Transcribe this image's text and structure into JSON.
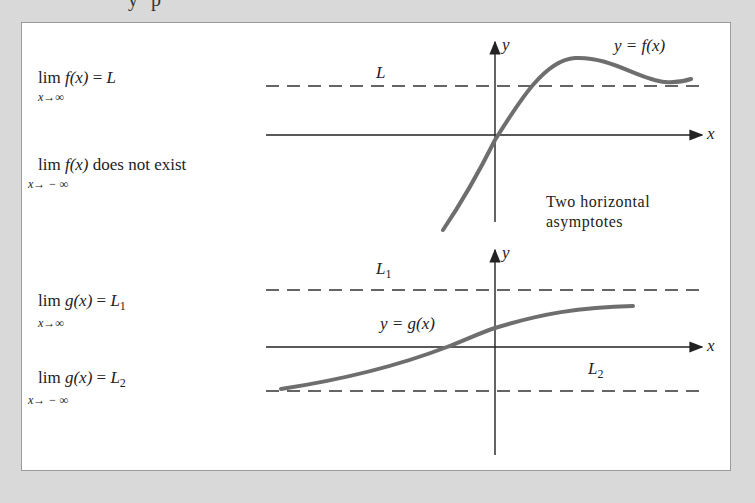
{
  "top_fragment": "y p",
  "figure": {
    "top": {
      "limit_pos_inf": {
        "expr": "lim f(x) = L",
        "lim": "lim",
        "func": "f(x)",
        "eq": "=",
        "value": "L",
        "sub": "x→∞"
      },
      "limit_neg_inf": {
        "lim": "lim",
        "func": "f(x)",
        "rest": "does not exist",
        "sub": "x→ − ∞"
      },
      "asymptote_label": "L",
      "curve_label": "y = f(x)",
      "axis_x": "x",
      "axis_y": "y",
      "note_line1": "Two horizontal",
      "note_line2": "asymptotes"
    },
    "bottom": {
      "limit_pos_inf": {
        "lim": "lim",
        "func": "g(x)",
        "eq": "=",
        "value": "L",
        "value_sub": "1",
        "sub": "x→∞"
      },
      "limit_neg_inf": {
        "lim": "lim",
        "func": "g(x)",
        "eq": "=",
        "value": "L",
        "value_sub": "2",
        "sub": "x→ − ∞"
      },
      "asymptote_upper": {
        "base": "L",
        "sub": "1"
      },
      "asymptote_lower": {
        "base": "L",
        "sub": "2"
      },
      "curve_label": "y = g(x)",
      "axis_x": "x",
      "axis_y": "y"
    },
    "colors": {
      "background": "#d9d9d9",
      "panel": "#ffffff",
      "curve": "#6e6e6e",
      "axis": "#222222"
    }
  }
}
